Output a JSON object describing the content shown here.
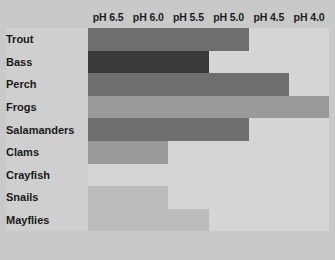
{
  "chart_data": {
    "type": "heatmap",
    "title": "",
    "xlabel": "",
    "ylabel": "",
    "categories": [
      "pH 6.5",
      "pH 6.0",
      "pH 5.5",
      "pH 5.0",
      "pH 4.5",
      "pH 4.0"
    ],
    "rows": [
      {
        "label": "Trout",
        "values": [
          3,
          3,
          3,
          3,
          0,
          0
        ]
      },
      {
        "label": "Bass",
        "values": [
          4,
          4,
          4,
          0,
          0,
          0
        ]
      },
      {
        "label": "Perch",
        "values": [
          3,
          3,
          3,
          3,
          3,
          0
        ]
      },
      {
        "label": "Frogs",
        "values": [
          2,
          2,
          2,
          2,
          2,
          2
        ]
      },
      {
        "label": "Salamanders",
        "values": [
          3,
          3,
          3,
          3,
          0,
          0
        ]
      },
      {
        "label": "Clams",
        "values": [
          2,
          2,
          0,
          0,
          0,
          0
        ]
      },
      {
        "label": "Crayfish",
        "values": [
          0,
          0,
          0,
          0,
          0,
          0
        ]
      },
      {
        "label": "Snails",
        "values": [
          1,
          1,
          0,
          0,
          0,
          0
        ]
      },
      {
        "label": "Mayflies",
        "values": [
          1,
          1,
          1,
          0,
          0,
          0
        ]
      }
    ],
    "value_scale": {
      "0": "#d5d5d5",
      "1": "#bcbcbc",
      "2": "#9a9a9a",
      "3": "#6e6e6e",
      "4": "#3a3a3a"
    },
    "grid": true,
    "legend": "none",
    "page_background": "#c9c9c9",
    "gridline_color": "#f2f2f2",
    "label_column_background": "#cfcfcf",
    "text_color": "#1a1a1a"
  }
}
